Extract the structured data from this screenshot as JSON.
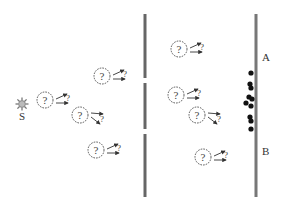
{
  "diagram": {
    "source": {
      "label": "S",
      "icon": "sun-icon",
      "x": 22,
      "y": 104
    },
    "barrier": {
      "x": 145,
      "segments": [
        [
          14,
          78
        ],
        [
          83,
          129
        ],
        [
          134,
          197
        ]
      ],
      "color": "#666666"
    },
    "screen": {
      "x": 256,
      "y1": 14,
      "y2": 197,
      "color": "#777777",
      "label_a": "A",
      "label_b": "B",
      "label_a_y": 61,
      "label_b_y": 155
    },
    "particle_symbol": "?",
    "arrow_symbol": "?",
    "particles_left": [
      {
        "x": 45,
        "y": 100,
        "arrows": "up"
      },
      {
        "x": 102,
        "y": 76,
        "arrows": "up"
      },
      {
        "x": 80,
        "y": 115,
        "arrows": "down"
      },
      {
        "x": 96,
        "y": 150,
        "arrows": "up"
      }
    ],
    "particles_right": [
      {
        "x": 179,
        "y": 49,
        "arrows": "up"
      },
      {
        "x": 176,
        "y": 95,
        "arrows": "up"
      },
      {
        "x": 197,
        "y": 115,
        "arrows": "down"
      },
      {
        "x": 203,
        "y": 157,
        "arrows": "up"
      }
    ],
    "hits": [
      {
        "x": 251,
        "y": 73
      },
      {
        "x": 250,
        "y": 84
      },
      {
        "x": 251,
        "y": 88
      },
      {
        "x": 249,
        "y": 97
      },
      {
        "x": 252,
        "y": 99
      },
      {
        "x": 246,
        "y": 103
      },
      {
        "x": 251,
        "y": 106
      },
      {
        "x": 250,
        "y": 117
      },
      {
        "x": 251,
        "y": 121
      },
      {
        "x": 251,
        "y": 129
      }
    ],
    "hit_color": "#111111"
  }
}
